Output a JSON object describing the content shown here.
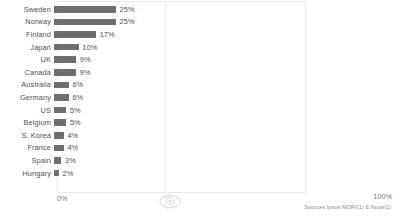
{
  "chart_data": {
    "type": "bar",
    "orientation": "horizontal",
    "title": "",
    "subtitle": "",
    "xlabel": "",
    "ylabel": "",
    "xlim": [
      0,
      100
    ],
    "grid": false,
    "legend": null,
    "axis_min_label": "0%",
    "axis_max_label": "100%",
    "categories": [
      "Sweden",
      "Norway",
      "Finland",
      "Japan",
      "UK",
      "Canada",
      "Australia",
      "Germany",
      "US",
      "Belgium",
      "S. Korea",
      "France",
      "Spain",
      "Hungary"
    ],
    "values": [
      25,
      25,
      17,
      10,
      9,
      9,
      6,
      6,
      5,
      5,
      4,
      4,
      3,
      2
    ],
    "value_labels": [
      "25%",
      "25%",
      "17%",
      "10%",
      "9%",
      "9%",
      "6%",
      "6%",
      "5%",
      "5%",
      "4%",
      "4%",
      "3%",
      "2%"
    ],
    "bars": [
      {
        "category": "Sweden",
        "value": 25,
        "label": "25%"
      },
      {
        "category": "Norway",
        "value": 25,
        "label": "25%"
      },
      {
        "category": "Finland",
        "value": 17,
        "label": "17%"
      },
      {
        "category": "Japan",
        "value": 10,
        "label": "10%"
      },
      {
        "category": "UK",
        "value": 9,
        "label": "9%"
      },
      {
        "category": "Canada",
        "value": 9,
        "label": "9%"
      },
      {
        "category": "Australia",
        "value": 6,
        "label": "6%"
      },
      {
        "category": "Germany",
        "value": 6,
        "label": "6%"
      },
      {
        "category": "US",
        "value": 5,
        "label": "5%"
      },
      {
        "category": "Belgium",
        "value": 5,
        "label": "5%"
      },
      {
        "category": "S. Korea",
        "value": 4,
        "label": "4%"
      },
      {
        "category": "France",
        "value": 4,
        "label": "4%"
      },
      {
        "category": "Spain",
        "value": 3,
        "label": "3%"
      },
      {
        "category": "Hungary",
        "value": 2,
        "label": "2%"
      }
    ],
    "colors": {
      "bar": "#6e6e70",
      "label_text": "#4f4f51",
      "axis_text": "#77777a",
      "frame": "#e9e9ea",
      "background": "#ffffff",
      "source_text": "#8e8e91"
    }
  },
  "footer": {
    "source": "Sources Ipsos MORI(1) & Nova(1)"
  },
  "watermark": {
    "icon": "circular-logo-watermark"
  }
}
